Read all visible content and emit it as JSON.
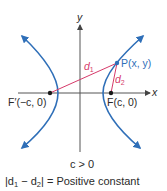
{
  "diagram": {
    "axes": {
      "x_label": "x",
      "y_label": "y"
    },
    "points": {
      "P": {
        "label": "P(x, y)"
      },
      "F": {
        "label": "F(c, 0)"
      },
      "F_prime": {
        "label": "F′(−c, 0)"
      }
    },
    "distances": {
      "d1": {
        "base": "d",
        "sub": "1"
      },
      "d2": {
        "base": "d",
        "sub": "2"
      }
    },
    "condition": "c > 0",
    "equation": {
      "left": "|d",
      "sub1": "1",
      "minus": " − d",
      "sub2": "2",
      "right": "| = Positive constant"
    },
    "colors": {
      "curve": "#2f6fb8",
      "distance_lines": "#d63a6a",
      "axes": "#555555",
      "point_p": "#2f6fb8",
      "foci": "#1a1a1a"
    }
  }
}
